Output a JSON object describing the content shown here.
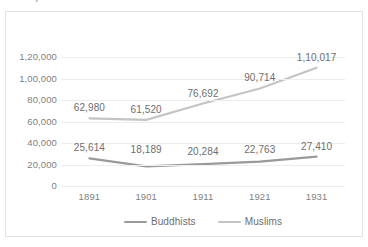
{
  "chart_data": {
    "type": "line",
    "title": "",
    "xlabel": "",
    "ylabel": "",
    "categories": [
      "1891",
      "1901",
      "1911",
      "1921",
      "1931"
    ],
    "series": [
      {
        "name": "Buddhists",
        "color": "#9a9a9a",
        "values": [
          25614,
          18189,
          20284,
          22763,
          27410
        ],
        "labels": [
          "25,614",
          "18,189",
          "20,284",
          "22,763",
          "27,410"
        ]
      },
      {
        "name": "Muslims",
        "color": "#c4c4c4",
        "values": [
          62980,
          61520,
          76692,
          90714,
          110017
        ],
        "labels": [
          "62,980",
          "61,520",
          "76,692",
          "90,714",
          "1,10,017"
        ]
      }
    ],
    "ylim": [
      0,
      120000
    ],
    "y_ticks": [
      {
        "value": 120000,
        "label": "1,20,000"
      },
      {
        "value": 100000,
        "label": "1,00,000"
      },
      {
        "value": 80000,
        "label": "80,000"
      },
      {
        "value": 60000,
        "label": "60,000"
      },
      {
        "value": 40000,
        "label": "40,000"
      },
      {
        "value": 20000,
        "label": "20,000"
      },
      {
        "value": 0,
        "label": "0"
      }
    ],
    "grid": true,
    "legend_position": "bottom",
    "number_format": "indian"
  },
  "legend": {
    "items": [
      {
        "label": "Buddhists"
      },
      {
        "label": "Muslims"
      }
    ]
  },
  "axis": {
    "y_tick_labels": [
      "1,20,000",
      "1,00,000",
      "80,000",
      "60,000",
      "40,000",
      "20,000",
      "0"
    ],
    "x_tick_labels": [
      "1891",
      "1901",
      "1911",
      "1921",
      "1931"
    ]
  },
  "labels": {
    "buddhists": [
      "25,614",
      "18,189",
      "20,284",
      "22,763",
      "27,410"
    ],
    "muslims": [
      "62,980",
      "61,520",
      "76,692",
      "90,714",
      "1,10,017"
    ]
  },
  "title_fragment": {
    "text": "Population"
  },
  "colors": {
    "buddhists_line": "#9a9a9a",
    "muslims_line": "#c4c4c4",
    "gridline": "#ededed",
    "frame": "#e2e2e2",
    "text": "#7f7f7f",
    "background": "#ffffff"
  }
}
